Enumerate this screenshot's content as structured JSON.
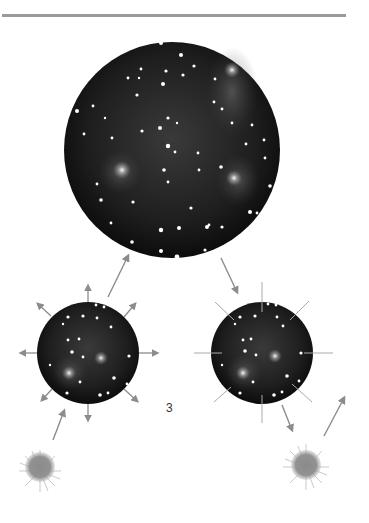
{
  "figure": {
    "panel_number": "3",
    "colors": {
      "rule": "#9a9a9a",
      "arrow": "#8c8c8c",
      "sky_dark": "#111111",
      "sky_haze": "#555555",
      "star": "#ffffff",
      "sun": "#8a8a8a"
    },
    "elements": {
      "top_rule": "horizontal-rule",
      "large_sky": "large-star-field-circle",
      "left_sky": "expanding-star-field-circle",
      "right_sky": "static-star-field-circle",
      "left_sun": "sun-blob",
      "right_sun": "sun-blob"
    }
  }
}
